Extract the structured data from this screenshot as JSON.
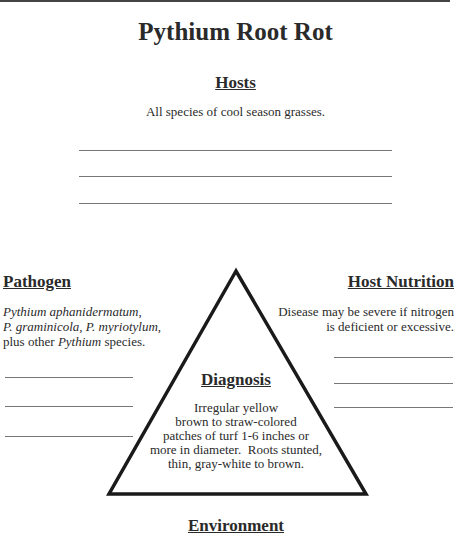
{
  "title": "Pythium Root Rot",
  "hosts": {
    "heading": "Hosts",
    "text": "All species of cool season grasses.",
    "blank_lines": 3
  },
  "pathogen": {
    "heading": "Pathogen",
    "line1": "Pythium aphanidermatum,",
    "line2": "P. graminicola, P. myriotylum,",
    "line3_prefix": "plus other ",
    "line3_italic": "Pythium",
    "line3_suffix": " species.",
    "blank_lines": 3
  },
  "host_nutrition": {
    "heading": "Host Nutrition",
    "line1": "Disease may be severe if nitrogen",
    "line2": "is deficient or excessive.",
    "blank_lines": 3
  },
  "diagnosis": {
    "heading": "Diagnosis",
    "lines": [
      "Irregular yellow",
      "brown to straw-colored",
      "patches of turf 1-6 inches or",
      "more in diameter.  Roots stunted,",
      "thin, gray-white to brown."
    ]
  },
  "environment": {
    "heading": "Environment"
  }
}
